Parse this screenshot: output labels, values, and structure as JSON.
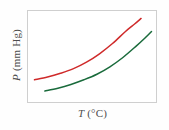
{
  "figure": {
    "background_color": "#fefefe",
    "frame_color": "#cfcfcf",
    "frame_background": "#ffffff"
  },
  "axes": {
    "ylabel_variable": "P",
    "ylabel_units": "(mm Hg)",
    "ylabel_full": "P (mm Hg)",
    "xlabel_variable": "T",
    "xlabel_units": "(°C)",
    "xlabel_full": "T (°C)"
  },
  "chart_data": {
    "type": "line",
    "title": "",
    "subtitle": "",
    "xlabel": "T (°C)",
    "ylabel": "P (mm Hg)",
    "xlim": [
      0,
      100
    ],
    "ylim": [
      0,
      100
    ],
    "grid": false,
    "legend": null,
    "legend_position": "none",
    "tick_labels": {
      "x": [],
      "y": []
    },
    "annotations": [],
    "series": [
      {
        "name": "upper-curve",
        "color": "#cf2a2a",
        "line_width": 1.5,
        "x": [
          5,
          15,
          25,
          35,
          45,
          55,
          65,
          75,
          82,
          87
        ],
        "y": [
          26,
          29,
          33,
          38,
          45,
          54,
          65,
          78,
          86,
          92
        ]
      },
      {
        "name": "lower-curve",
        "color": "#1a6b3c",
        "line_width": 1.5,
        "x": [
          13,
          23,
          33,
          43,
          53,
          63,
          73,
          83,
          90,
          95
        ],
        "y": [
          14,
          17,
          21,
          26,
          32,
          40,
          50,
          62,
          71,
          78
        ]
      }
    ]
  }
}
